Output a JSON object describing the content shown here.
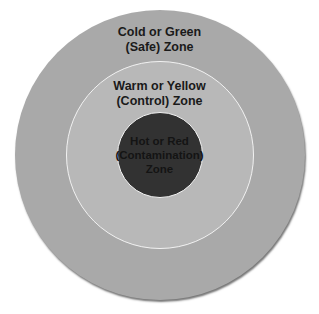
{
  "diagram": {
    "type": "concentric-zones",
    "zones": [
      {
        "id": "outer",
        "lines": [
          "Cold or Green",
          "(Safe) Zone"
        ],
        "color": "#a9a9a9"
      },
      {
        "id": "middle",
        "lines": [
          "Warm or Yellow",
          "(Control) Zone"
        ],
        "color": "#b8b8b8"
      },
      {
        "id": "inner",
        "lines": [
          "Hot or Red",
          "(Contamination)",
          "Zone"
        ],
        "color": "#323232"
      }
    ]
  }
}
